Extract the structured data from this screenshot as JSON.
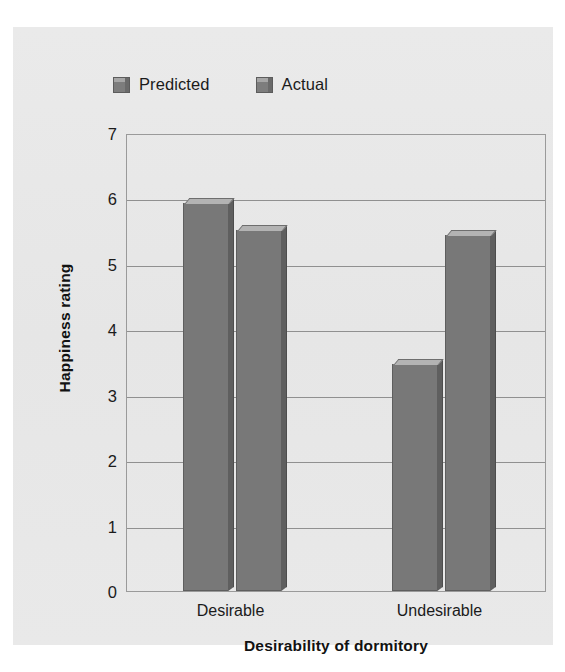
{
  "chart_data": {
    "type": "bar",
    "title": "",
    "xlabel": "Desirability of dormitory",
    "ylabel": "Happiness rating",
    "categories": [
      "Desirable",
      "Undesirable"
    ],
    "series": [
      {
        "name": "Predicted",
        "values": [
          5.93,
          3.47
        ]
      },
      {
        "name": "Actual",
        "values": [
          5.52,
          5.44
        ]
      }
    ],
    "ylim": [
      0,
      7
    ],
    "yticks": [
      "0",
      "1",
      "2",
      "3",
      "4",
      "5",
      "6",
      "7"
    ],
    "grid": true,
    "legend_position": "top-left",
    "colors": {
      "bar_face": "#787878",
      "bar_top": "#b3b3b3",
      "bar_side": "#5f5f5f",
      "panel_background": "#e8e8e8",
      "gridline": "#909090",
      "text": "#1b1b1b"
    }
  },
  "legend": {
    "items": [
      {
        "label": "Predicted",
        "swatch": "legend-swatch-predicted"
      },
      {
        "label": "Actual",
        "swatch": "legend-swatch-actual"
      }
    ]
  }
}
